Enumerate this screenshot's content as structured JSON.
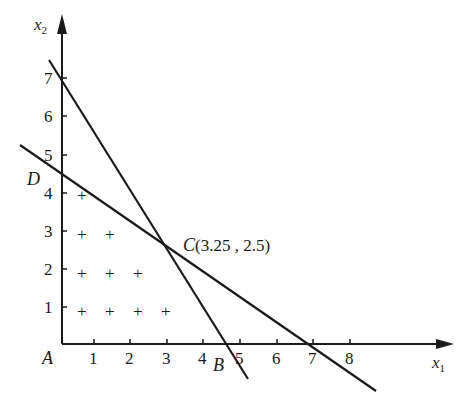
{
  "diagram": {
    "type": "linear-programming-feasible-region",
    "axes": {
      "x": {
        "label_main": "x",
        "label_sub": "1",
        "ticks": [
          "1",
          "2",
          "3",
          "4",
          "5",
          "6",
          "7",
          "8"
        ]
      },
      "y": {
        "label_main": "x",
        "label_sub": "2",
        "ticks": [
          "1",
          "2",
          "3",
          "4",
          "5",
          "6",
          "7"
        ]
      }
    },
    "points": {
      "A": {
        "label": "A"
      },
      "B": {
        "label": "B"
      },
      "D": {
        "label": "D"
      },
      "C": {
        "label": "C",
        "coords": "(3.25 , 2.5)"
      }
    },
    "lines": [
      {
        "name": "steep-constraint-line",
        "y_intercept": 7,
        "x_intercept": 4.6
      },
      {
        "name": "shallow-constraint-line",
        "y_intercept": 4.5,
        "x_intercept": 6.9
      }
    ],
    "integer_points_marker": "+",
    "integer_points": [
      [
        1,
        4
      ],
      [
        1,
        3
      ],
      [
        2,
        3
      ],
      [
        1,
        2
      ],
      [
        2,
        2
      ],
      [
        3,
        2
      ],
      [
        1,
        1
      ],
      [
        2,
        1
      ],
      [
        3,
        1
      ],
      [
        4,
        1
      ]
    ]
  }
}
